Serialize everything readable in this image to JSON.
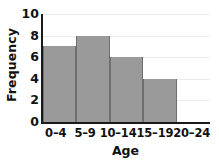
{
  "chart_data": {
    "type": "bar",
    "title": "",
    "xlabel": "Age",
    "ylabel": "Frequency",
    "categories": [
      "0–4",
      "5–9",
      "10–14",
      "15–19",
      "20–24"
    ],
    "values": [
      7,
      8,
      6,
      4,
      0
    ],
    "ylim": [
      0,
      10
    ],
    "yticks": [
      0,
      2,
      4,
      6,
      8,
      10
    ],
    "ytick_labels": [
      "0",
      "2",
      "4",
      "6",
      "8",
      "10"
    ],
    "grid": true,
    "legend": "none",
    "bar_color": "#9a9a9a",
    "bar_edge_color": "#6f6f6f",
    "axis_color": "#1a1a1a",
    "grid_color": "#ececec",
    "background": "#ffffff"
  }
}
